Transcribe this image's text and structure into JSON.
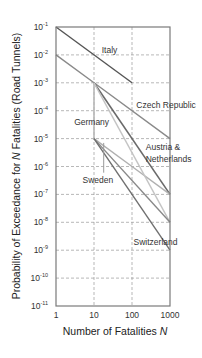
{
  "chart_data": {
    "type": "line",
    "title": "",
    "xlabel": "Number of  Fatalities N",
    "xlabel_parts": [
      "Number of  Fatalities ",
      "N"
    ],
    "ylabel": "Probability of Exceedance for N Fatalities (Road Tunnels)",
    "ylabel_parts": [
      "Probability of Exceedance for ",
      "N",
      " Fatalities (Road Tunnels)"
    ],
    "xscale": "log",
    "yscale": "log",
    "xlim": [
      1,
      1000
    ],
    "ylim": [
      1e-11,
      0.1
    ],
    "grid": true,
    "legend": "none (inline annotations)",
    "x_ticks": [
      {
        "value": 1,
        "label": "1"
      },
      {
        "value": 10,
        "label": "10"
      },
      {
        "value": 100,
        "label": "100"
      },
      {
        "value": 1000,
        "label": "1000"
      }
    ],
    "y_ticks": [
      {
        "value": 0.1,
        "base": "10",
        "exp": "-1"
      },
      {
        "value": 0.01,
        "base": "10",
        "exp": "-2"
      },
      {
        "value": 0.001,
        "base": "10",
        "exp": "-3"
      },
      {
        "value": 0.0001,
        "base": "10",
        "exp": "-4"
      },
      {
        "value": 1e-05,
        "base": "10",
        "exp": "-5"
      },
      {
        "value": 1e-06,
        "base": "10",
        "exp": "-6"
      },
      {
        "value": 1e-07,
        "base": "10",
        "exp": "-7"
      },
      {
        "value": 1e-08,
        "base": "10",
        "exp": "-8"
      },
      {
        "value": 1e-09,
        "base": "10",
        "exp": "-9"
      },
      {
        "value": 1e-10,
        "base": "10",
        "exp": "-10"
      },
      {
        "value": 1e-11,
        "base": "10",
        "exp": "-11"
      }
    ],
    "series": [
      {
        "name": "Italy",
        "color": "#555555",
        "width": 1.4,
        "points": [
          [
            1,
            0.1
          ],
          [
            100,
            0.001
          ]
        ]
      },
      {
        "name": "Czech Republic",
        "color": "#8a8a8a",
        "width": 1.4,
        "points": [
          [
            1,
            0.01
          ],
          [
            10,
            0.001
          ],
          [
            1000,
            1e-05
          ]
        ]
      },
      {
        "name": "Austria & Netherlands",
        "color": "#6a6a6a",
        "width": 1.6,
        "points": [
          [
            10,
            0.001
          ],
          [
            1000,
            1e-07
          ]
        ]
      },
      {
        "name": "Austria & Netherlands (upper)",
        "color": "#b8b8b8",
        "width": 1.6,
        "points": [
          [
            10,
            0.001
          ],
          [
            10,
            1e-05
          ]
        ]
      },
      {
        "name": "Germany",
        "color": "#b0b0b0",
        "width": 1.4,
        "points": [
          [
            10,
            1e-05
          ],
          [
            100,
            1e-06
          ],
          [
            1000,
            1e-07
          ]
        ]
      },
      {
        "name": "Germany (lower)",
        "color": "#c4c4c4",
        "width": 1.4,
        "points": [
          [
            10,
            0.001
          ],
          [
            1000,
            1e-08
          ]
        ]
      },
      {
        "name": "Sweden",
        "color": "#888888",
        "width": 1.4,
        "points": [
          [
            10,
            1e-05
          ],
          [
            1000,
            1e-08
          ]
        ]
      },
      {
        "name": "Switzerland",
        "color": "#707070",
        "width": 1.4,
        "points": [
          [
            10,
            1e-05
          ],
          [
            1000,
            1e-09
          ]
        ]
      }
    ],
    "annotations": [
      {
        "text": "Italy",
        "x": 16,
        "y": 0.012
      },
      {
        "text": "Czech Republic",
        "x": 130,
        "y": 0.00013
      },
      {
        "text": "Austria &",
        "x": 230,
        "y": 4e-06
      },
      {
        "text": "Netherlands",
        "x": 230,
        "y": 1.5e-06
      },
      {
        "text": "Germany",
        "x": 3,
        "y": 3e-05
      },
      {
        "text": "Sweden",
        "x": 5,
        "y": 2.5e-07
      },
      {
        "text": "Switzerland",
        "x": 110,
        "y": 1.5e-09
      }
    ]
  }
}
